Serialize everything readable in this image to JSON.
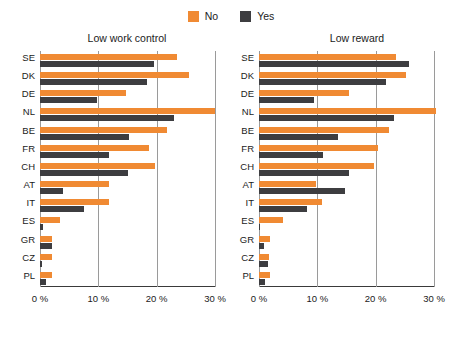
{
  "legend": {
    "entries": [
      {
        "label": "No",
        "color": "#F08A33"
      },
      {
        "label": "Yes",
        "color": "#3D3D40"
      }
    ]
  },
  "axis": {
    "ticks": [
      "0 %",
      "10 %",
      "20 %",
      "30 %"
    ],
    "tick_values": [
      0,
      10,
      20,
      30
    ]
  },
  "chart_data": [
    {
      "type": "bar",
      "orientation": "horizontal",
      "title": "Low work control",
      "xlabel": "",
      "ylabel": "",
      "xlim": [
        0,
        30
      ],
      "xticks": [
        0,
        10,
        20,
        30
      ],
      "xticklabels": [
        "0 %",
        "10 %",
        "20 %",
        "30 %"
      ],
      "grid": true,
      "legend_position": "top-center",
      "categories": [
        "SE",
        "DK",
        "DE",
        "NL",
        "BE",
        "FR",
        "CH",
        "AT",
        "IT",
        "ES",
        "GR",
        "CZ",
        "PL"
      ],
      "series": [
        {
          "name": "No",
          "color": "#F08A33",
          "values": [
            23.5,
            25.5,
            14.8,
            30.0,
            21.7,
            18.6,
            19.7,
            11.9,
            11.9,
            3.4,
            2.1,
            2.0,
            2.0
          ]
        },
        {
          "name": "Yes",
          "color": "#3D3D40",
          "values": [
            19.5,
            18.3,
            9.7,
            22.9,
            15.3,
            11.9,
            15.1,
            4.0,
            7.6,
            0.5,
            2.1,
            0.3,
            1.0
          ]
        }
      ]
    },
    {
      "type": "bar",
      "orientation": "horizontal",
      "title": "Low reward",
      "xlabel": "",
      "ylabel": "",
      "xlim": [
        0,
        30
      ],
      "xticks": [
        0,
        10,
        20,
        30
      ],
      "xticklabels": [
        "0 %",
        "10 %",
        "20 %",
        "30 %"
      ],
      "grid": true,
      "legend_position": "top-center",
      "categories": [
        "SE",
        "DK",
        "DE",
        "NL",
        "BE",
        "FR",
        "CH",
        "AT",
        "IT",
        "ES",
        "GR",
        "CZ",
        "PL"
      ],
      "series": [
        {
          "name": "No",
          "color": "#F08A33",
          "values": [
            23.4,
            25.2,
            15.4,
            30.3,
            22.2,
            20.4,
            19.7,
            9.7,
            10.8,
            4.1,
            1.9,
            1.7,
            1.9
          ]
        },
        {
          "name": "Yes",
          "color": "#3D3D40",
          "values": [
            25.7,
            21.7,
            9.5,
            23.1,
            13.6,
            11.0,
            15.4,
            14.8,
            8.2,
            0.2,
            0.9,
            1.5,
            1.0
          ]
        }
      ]
    }
  ]
}
